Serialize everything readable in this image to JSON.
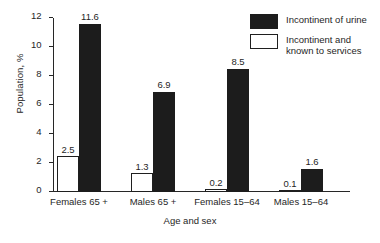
{
  "chart_data": {
    "type": "bar",
    "title": "",
    "xlabel": "Age and sex",
    "ylabel": "Population, %",
    "ylim": [
      0,
      12
    ],
    "yticks": [
      0,
      2,
      4,
      6,
      8,
      10,
      12
    ],
    "ytick_labels": [
      "0",
      "2",
      "4",
      "6",
      "8",
      "10",
      "12"
    ],
    "grid": false,
    "legend_position": "top-right",
    "categories": [
      "Females 65 +",
      "Males 65 +",
      "Females 15–64",
      "Males 15–64"
    ],
    "series": [
      {
        "name": "Incontinent and known to services",
        "style": "hollow",
        "color": "#ffffff",
        "edge_color": "#1f1f1f",
        "values": [
          2.5,
          1.3,
          0.2,
          0.1
        ],
        "value_labels": [
          "2.5",
          "1.3",
          "0.2",
          "0.1"
        ]
      },
      {
        "name": "Incontinent of urine",
        "style": "filled",
        "color": "#1c1c1c",
        "edge_color": "#1c1c1c",
        "values": [
          11.6,
          6.9,
          8.5,
          1.6
        ],
        "value_labels": [
          "11.6",
          "6.9",
          "8.5",
          "1.6"
        ]
      }
    ]
  },
  "legend": {
    "entries": [
      {
        "label": "Incontinent of urine",
        "swatch": "filled"
      },
      {
        "label": "Incontinent and\nknown to services",
        "swatch": "hollow"
      }
    ]
  }
}
